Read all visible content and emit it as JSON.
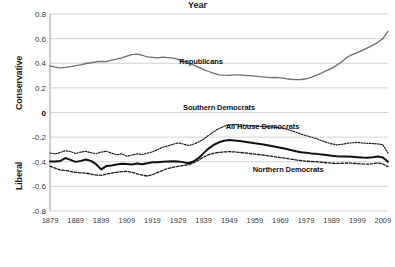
{
  "chart_data": {
    "type": "line",
    "title": "",
    "xlabel": "Year",
    "ylabel_top": "Conservative",
    "ylabel_bottom": "Liberal",
    "xlim": [
      1879,
      2011
    ],
    "ylim": [
      -0.8,
      0.8
    ],
    "grid": true,
    "legend_position": "inline-annotations",
    "yticks": [
      "0.8",
      "0.6",
      "0.4",
      "0.2",
      "0",
      "-0.2",
      "-0.4",
      "-0.6",
      "-0.8"
    ],
    "ytick_values": [
      0.8,
      0.6,
      0.4,
      0.2,
      0,
      -0.2,
      -0.4,
      -0.6,
      -0.8
    ],
    "xticks": [
      "1879",
      "1889",
      "1899",
      "1909",
      "1919",
      "1929",
      "1939",
      "1949",
      "1959",
      "1969",
      "1979",
      "1989",
      "1999",
      "2009"
    ],
    "xtick_values": [
      1879,
      1889,
      1899,
      1909,
      1919,
      1929,
      1939,
      1949,
      1959,
      1969,
      1979,
      1989,
      1999,
      2009
    ],
    "x": [
      1879,
      1881,
      1883,
      1885,
      1887,
      1889,
      1891,
      1893,
      1895,
      1897,
      1899,
      1901,
      1903,
      1905,
      1907,
      1909,
      1911,
      1913,
      1915,
      1917,
      1919,
      1921,
      1923,
      1925,
      1927,
      1929,
      1931,
      1933,
      1935,
      1937,
      1939,
      1941,
      1943,
      1945,
      1947,
      1949,
      1951,
      1953,
      1955,
      1957,
      1959,
      1961,
      1963,
      1965,
      1967,
      1969,
      1971,
      1973,
      1975,
      1977,
      1979,
      1981,
      1983,
      1985,
      1987,
      1989,
      1991,
      1993,
      1995,
      1997,
      1999,
      2001,
      2003,
      2005,
      2007,
      2009,
      2011
    ],
    "series": [
      {
        "name": "Republicans",
        "style": "solid-gray",
        "color": "#6e6e6e",
        "values": [
          0.379,
          0.369,
          0.362,
          0.366,
          0.372,
          0.381,
          0.387,
          0.398,
          0.404,
          0.412,
          0.416,
          0.414,
          0.425,
          0.434,
          0.444,
          0.457,
          0.47,
          0.474,
          0.465,
          0.452,
          0.447,
          0.443,
          0.45,
          0.446,
          0.441,
          0.431,
          0.418,
          0.403,
          0.387,
          0.368,
          0.348,
          0.333,
          0.318,
          0.306,
          0.303,
          0.302,
          0.305,
          0.305,
          0.302,
          0.299,
          0.296,
          0.291,
          0.287,
          0.283,
          0.285,
          0.281,
          0.275,
          0.27,
          0.267,
          0.268,
          0.274,
          0.285,
          0.302,
          0.32,
          0.34,
          0.358,
          0.385,
          0.412,
          0.448,
          0.47,
          0.487,
          0.505,
          0.525,
          0.545,
          0.57,
          0.6,
          0.66
        ]
      },
      {
        "name": "Southern Democrats",
        "style": "fine-dotted",
        "color": "#1a1a1a",
        "values": [
          -0.329,
          -0.336,
          -0.325,
          -0.31,
          -0.317,
          -0.333,
          -0.322,
          -0.316,
          -0.327,
          -0.335,
          -0.321,
          -0.315,
          -0.33,
          -0.344,
          -0.336,
          -0.355,
          -0.345,
          -0.336,
          -0.341,
          -0.33,
          -0.32,
          -0.302,
          -0.283,
          -0.272,
          -0.258,
          -0.247,
          -0.256,
          -0.268,
          -0.258,
          -0.24,
          -0.215,
          -0.185,
          -0.155,
          -0.13,
          -0.112,
          -0.102,
          -0.098,
          -0.1,
          -0.104,
          -0.106,
          -0.109,
          -0.112,
          -0.115,
          -0.117,
          -0.12,
          -0.126,
          -0.134,
          -0.145,
          -0.16,
          -0.175,
          -0.188,
          -0.2,
          -0.212,
          -0.228,
          -0.243,
          -0.255,
          -0.263,
          -0.258,
          -0.25,
          -0.246,
          -0.243,
          -0.248,
          -0.25,
          -0.252,
          -0.255,
          -0.262,
          -0.33
        ]
      },
      {
        "name": "All House Democrats",
        "style": "thick-solid",
        "color": "#111111",
        "values": [
          -0.397,
          -0.398,
          -0.393,
          -0.37,
          -0.385,
          -0.401,
          -0.393,
          -0.382,
          -0.393,
          -0.42,
          -0.462,
          -0.435,
          -0.43,
          -0.423,
          -0.416,
          -0.419,
          -0.423,
          -0.415,
          -0.421,
          -0.412,
          -0.404,
          -0.404,
          -0.4,
          -0.398,
          -0.396,
          -0.398,
          -0.403,
          -0.412,
          -0.398,
          -0.371,
          -0.33,
          -0.291,
          -0.262,
          -0.242,
          -0.23,
          -0.224,
          -0.227,
          -0.232,
          -0.238,
          -0.244,
          -0.25,
          -0.256,
          -0.262,
          -0.27,
          -0.278,
          -0.286,
          -0.295,
          -0.304,
          -0.314,
          -0.322,
          -0.327,
          -0.332,
          -0.336,
          -0.341,
          -0.346,
          -0.352,
          -0.356,
          -0.357,
          -0.357,
          -0.36,
          -0.363,
          -0.366,
          -0.368,
          -0.364,
          -0.358,
          -0.366,
          -0.4
        ]
      },
      {
        "name": "Northern Democrats",
        "style": "dashed",
        "color": "#1a1a1a",
        "values": [
          -0.435,
          -0.452,
          -0.468,
          -0.47,
          -0.478,
          -0.486,
          -0.49,
          -0.492,
          -0.5,
          -0.508,
          -0.51,
          -0.5,
          -0.492,
          -0.486,
          -0.48,
          -0.478,
          -0.486,
          -0.498,
          -0.508,
          -0.516,
          -0.505,
          -0.487,
          -0.47,
          -0.455,
          -0.445,
          -0.438,
          -0.43,
          -0.425,
          -0.41,
          -0.388,
          -0.362,
          -0.342,
          -0.33,
          -0.324,
          -0.32,
          -0.318,
          -0.32,
          -0.324,
          -0.328,
          -0.333,
          -0.338,
          -0.343,
          -0.348,
          -0.354,
          -0.36,
          -0.366,
          -0.372,
          -0.378,
          -0.385,
          -0.39,
          -0.395,
          -0.398,
          -0.4,
          -0.404,
          -0.408,
          -0.412,
          -0.414,
          -0.412,
          -0.41,
          -0.412,
          -0.415,
          -0.418,
          -0.42,
          -0.416,
          -0.41,
          -0.418,
          -0.44
        ]
      }
    ],
    "annotations": [
      {
        "text": "Republicans",
        "x": 1938,
        "y": 0.41
      },
      {
        "text": "Southern Democrats",
        "x": 1945,
        "y": 0.035
      },
      {
        "text": "All House Democrats",
        "x": 1962,
        "y": -0.115
      },
      {
        "text": "Northern Democrats",
        "x": 1972,
        "y": -0.465
      }
    ]
  },
  "colors": {
    "gridline": "#c8c8c8",
    "axis": "#9a9a9a",
    "republican_line": "#6e6e6e",
    "democrat_line": "#111111",
    "background": "#ffffff"
  }
}
